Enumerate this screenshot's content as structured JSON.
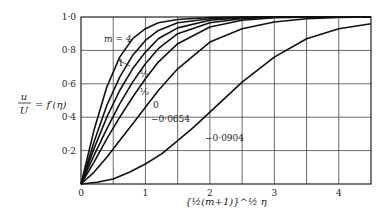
{
  "chart_data": {
    "type": "line",
    "title": "",
    "xlabel": "{½(m+1)}^½ η",
    "ylabel": "u/U = f′(η)",
    "xlim": [
      0,
      4.5
    ],
    "ylim": [
      0,
      1.0
    ],
    "grid": true,
    "x_ticks": [
      "0",
      "1",
      "2",
      "3",
      "4"
    ],
    "y_ticks": [
      "0",
      "0·2",
      "0·4",
      "0·6",
      "0·8",
      "1·0"
    ],
    "series": [
      {
        "name": "m = 4",
        "label": "m = 4",
        "x": [
          0,
          0.2,
          0.4,
          0.6,
          0.8,
          1.0,
          1.2,
          1.5,
          2.0,
          2.5,
          3.0,
          4.5
        ],
        "values": [
          0,
          0.32,
          0.58,
          0.76,
          0.87,
          0.93,
          0.965,
          0.985,
          0.997,
          1.0,
          1.0,
          1.0
        ]
      },
      {
        "name": "m = 1",
        "label": "1",
        "x": [
          0,
          0.2,
          0.4,
          0.6,
          0.8,
          1.0,
          1.2,
          1.5,
          2.0,
          2.5,
          3.0,
          4.5
        ],
        "values": [
          0,
          0.25,
          0.47,
          0.64,
          0.77,
          0.86,
          0.92,
          0.965,
          0.99,
          0.998,
          1.0,
          1.0
        ]
      },
      {
        "name": "m = 1/3",
        "label": "⅓",
        "x": [
          0,
          0.2,
          0.4,
          0.6,
          0.8,
          1.0,
          1.2,
          1.5,
          2.0,
          2.5,
          3.0,
          4.5
        ],
        "values": [
          0,
          0.21,
          0.4,
          0.56,
          0.69,
          0.79,
          0.87,
          0.935,
          0.98,
          0.995,
          1.0,
          1.0
        ]
      },
      {
        "name": "m = 1/9",
        "label": "⅑",
        "x": [
          0,
          0.2,
          0.4,
          0.6,
          0.8,
          1.0,
          1.2,
          1.5,
          2.0,
          2.5,
          3.0,
          4.5
        ],
        "values": [
          0,
          0.17,
          0.33,
          0.48,
          0.61,
          0.72,
          0.81,
          0.9,
          0.965,
          0.99,
          0.998,
          1.0
        ]
      },
      {
        "name": "m = 0",
        "label": "0",
        "x": [
          0,
          0.2,
          0.4,
          0.6,
          0.8,
          1.0,
          1.2,
          1.5,
          2.0,
          2.5,
          3.0,
          3.5,
          4.5
        ],
        "values": [
          0,
          0.13,
          0.27,
          0.4,
          0.52,
          0.63,
          0.73,
          0.84,
          0.94,
          0.98,
          0.995,
          0.999,
          1.0
        ]
      },
      {
        "name": "m = -0.0654",
        "label": "−0·0654",
        "x": [
          0,
          0.2,
          0.4,
          0.6,
          0.8,
          1.0,
          1.2,
          1.5,
          2.0,
          2.5,
          3.0,
          3.5,
          4.0,
          4.5
        ],
        "values": [
          0,
          0.07,
          0.16,
          0.26,
          0.36,
          0.46,
          0.56,
          0.69,
          0.85,
          0.93,
          0.97,
          0.99,
          0.997,
          1.0
        ]
      },
      {
        "name": "m = -0.0904",
        "label": "−0·0904",
        "x": [
          0,
          0.25,
          0.5,
          0.75,
          1.0,
          1.25,
          1.5,
          1.75,
          2.0,
          2.5,
          3.0,
          3.5,
          4.0,
          4.5
        ],
        "values": [
          0,
          0.01,
          0.03,
          0.07,
          0.12,
          0.18,
          0.26,
          0.34,
          0.43,
          0.61,
          0.76,
          0.87,
          0.93,
          0.96
        ]
      }
    ]
  }
}
